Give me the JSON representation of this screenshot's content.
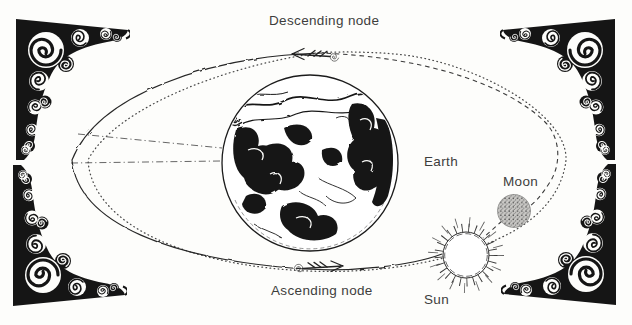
{
  "diagram": {
    "title_context": "lunar nodes orbital diagram",
    "labels": {
      "descending_node": "Descending node",
      "ascending_node": "Ascending node",
      "earth": "Earth",
      "moon": "Moon",
      "sun": "Sun"
    },
    "legend": {
      "solid_line": "Moon orbit (near side)",
      "dashed_line": "Moon orbit (far side)",
      "dotted_line": "ecliptic plane",
      "dashdot_lines": "line of nodes"
    },
    "icons": {
      "corner_ornament": "filigree-corner-ornament",
      "node_arrow_top": "arrow-left-curled",
      "node_arrow_bottom": "arrow-right-curled"
    },
    "colors": {
      "ink": "#1c1c1c",
      "label_text": "#3d3d3d",
      "background": "#fdfdfb",
      "moon_fill": "#c9c8c5"
    }
  }
}
